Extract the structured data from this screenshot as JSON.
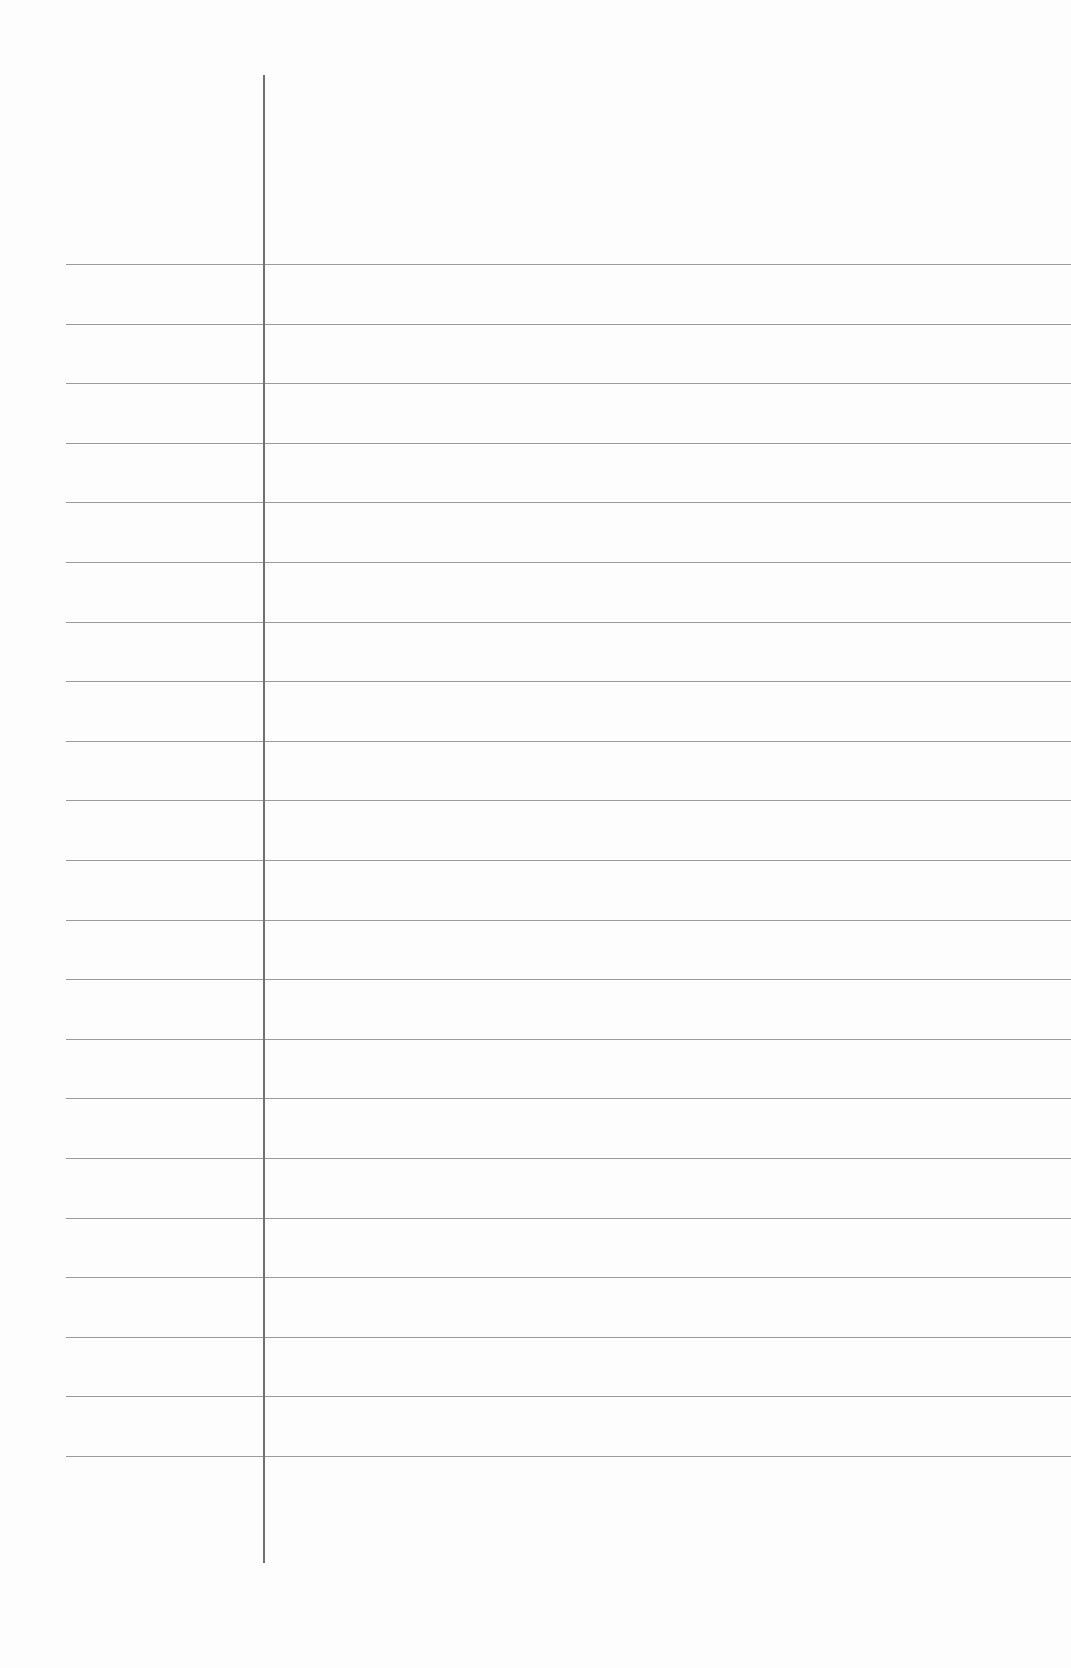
{
  "page": {
    "type": "blank ruled paper",
    "background_color": "#fdfdfd",
    "rule_color": "#9a9a9a",
    "margin_line_color": "#6f6f6f"
  },
  "rules": {
    "count": 21,
    "first_y": 264,
    "spacing": 59.6,
    "left_x": 66
  },
  "margin_line": {
    "x": 263,
    "top": 75,
    "bottom": 1563
  }
}
